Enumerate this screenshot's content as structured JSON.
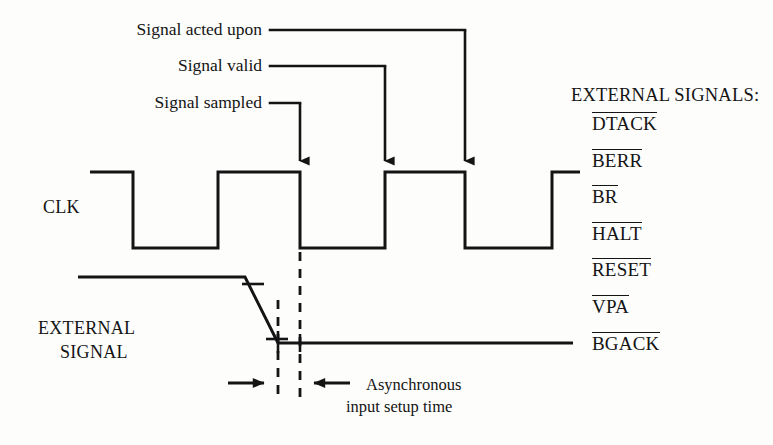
{
  "diagram": {
    "callouts": [
      {
        "label": "Signal acted upon",
        "leader_to_x": 465,
        "text_right_x": 262,
        "text_y": 30
      },
      {
        "label": "Signal valid",
        "leader_to_x": 385,
        "text_right_x": 262,
        "text_y": 66
      },
      {
        "label": "Signal sampled",
        "leader_to_x": 300,
        "text_right_x": 262,
        "text_y": 103
      }
    ],
    "waveforms": [
      {
        "name": "CLK",
        "label": "CLK",
        "label_x": 43,
        "label_y": 207,
        "high_y": 172,
        "low_y": 248,
        "start_x": 90,
        "end_x": 580,
        "edges": [
          133,
          218,
          300,
          385,
          465,
          552
        ],
        "initial_level": "high"
      },
      {
        "name": "EXTERNAL SIGNAL",
        "label_line1": "EXTERNAL",
        "label_line2": "SIGNAL",
        "label_x": 38,
        "label_y1": 328,
        "label_y2": 352,
        "high_y": 277,
        "low_y": 343,
        "start_x": 78,
        "fall_start_x": 245,
        "fall_end_x": 278,
        "end_x": 573
      }
    ],
    "sample_arrows": [
      {
        "x": 300,
        "from_y": 103,
        "to_y": 172
      },
      {
        "x": 385,
        "from_y": 66,
        "to_y": 172
      },
      {
        "x": 465,
        "from_y": 30,
        "to_y": 172
      }
    ],
    "dashed_markers": [
      {
        "x": 278,
        "y1": 300,
        "y2": 397
      },
      {
        "x": 300,
        "y1": 252,
        "y2": 397
      }
    ],
    "setup_measure": {
      "arrow_y": 383,
      "left_arrow_from_x": 228,
      "left_arrow_to_x": 276,
      "right_arrow_from_x": 350,
      "right_arrow_to_x": 302,
      "note_line1": "Asynchronous",
      "note_line2": "input setup time",
      "note_x": 366,
      "note_y": 374
    },
    "external_signals": {
      "heading": "EXTERNAL SIGNALS:",
      "heading_x": 571,
      "heading_y": 86,
      "names_x": 592,
      "first_name_y": 112,
      "name_spacing": 36.6,
      "items": [
        {
          "label": "DTACK",
          "overbar": true
        },
        {
          "label": "BERR",
          "overbar": true
        },
        {
          "label": "BR",
          "overbar": true
        },
        {
          "label": "HALT",
          "overbar": true
        },
        {
          "label": "RESET",
          "overbar": true
        },
        {
          "label": "VPA",
          "overbar": true
        },
        {
          "label": "BGACK",
          "overbar": true
        }
      ]
    },
    "colors": {
      "ink": "#141414",
      "background": "#fdfdfc"
    }
  }
}
